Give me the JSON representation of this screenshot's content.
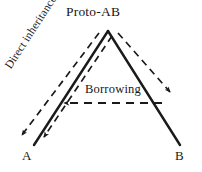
{
  "diagram": {
    "type": "language-family-tree",
    "background_color": "#ffffff",
    "line_color": "#1a1a1a",
    "nodes": [
      {
        "id": "proto",
        "label": "Proto-AB",
        "x": 108,
        "y": 28
      },
      {
        "id": "a",
        "label": "A",
        "x": 27,
        "y": 156
      },
      {
        "id": "b",
        "label": "B",
        "x": 179,
        "y": 156
      }
    ],
    "edges": [
      {
        "id": "proto-to-a",
        "style": "solid",
        "from": "proto",
        "to": "a",
        "arrowhead": false
      },
      {
        "id": "proto-to-b",
        "style": "solid",
        "from": "proto",
        "to": "b",
        "arrowhead": false
      },
      {
        "id": "inheritance-outer",
        "style": "dashed",
        "from": "proto",
        "to": "a",
        "arrowhead": true
      },
      {
        "id": "inheritance-inner",
        "style": "dashed",
        "from": "proto",
        "to": "a",
        "arrowhead": true
      },
      {
        "id": "proto-to-b-dashed",
        "style": "dashed",
        "from": "proto",
        "to": "b",
        "arrowhead": true
      },
      {
        "id": "borrowing-arrow",
        "style": "dashed",
        "from": "b-branch",
        "to": "a-branch",
        "arrowhead": true,
        "direction": "leftward"
      }
    ],
    "edge_labels": [
      {
        "id": "direct-inheritance",
        "text": "Direct inheritance",
        "rotation_deg": -57
      },
      {
        "id": "borrowing",
        "text": "Borrowing",
        "rotation_deg": 0
      }
    ]
  }
}
